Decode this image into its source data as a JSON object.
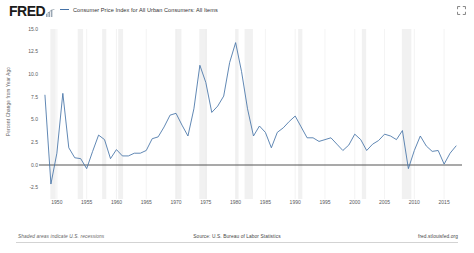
{
  "header": {
    "logo": "FRED",
    "logo_mark": "fred-bar-mark",
    "legend_label": "Consumer Price Index for All Urban Consumers: All Items",
    "legend_color": "#4572a7",
    "expand_label": "expand-icon"
  },
  "footer": {
    "left": "Shaded areas indicate U.S. recessions",
    "center": "Source: U.S. Bureau of Labor Statistics",
    "right": "fred.stlouisfed.org"
  },
  "chart_data": {
    "type": "line",
    "title": "Consumer Price Index for All Urban Consumers: All Items",
    "xlabel": "",
    "ylabel": "Percent Change from Year Ago",
    "grid": true,
    "legend_position": "top",
    "line_color": "#4572a7",
    "zero_line_color": "#555555",
    "recession_band_color": "#e6e6e6",
    "xlim": [
      1947,
      2018
    ],
    "ylim": [
      -3.75,
      15.0
    ],
    "ytick_labels": [
      "15.0",
      "12.5",
      "10.0",
      "7.5",
      "5.0",
      "2.5",
      "0.0",
      "-2.5"
    ],
    "ytick_values": [
      15.0,
      12.5,
      10.0,
      7.5,
      5.0,
      2.5,
      0.0,
      -2.5
    ],
    "xtick_labels": [
      "1950",
      "1955",
      "1960",
      "1965",
      "1970",
      "1975",
      "1980",
      "1985",
      "1990",
      "1995",
      "2000",
      "2005",
      "2010",
      "2015"
    ],
    "xtick_values": [
      1950,
      1955,
      1960,
      1965,
      1970,
      1975,
      1980,
      1985,
      1990,
      1995,
      2000,
      2005,
      2010,
      2015
    ],
    "x": [
      1948,
      1949,
      1950,
      1951,
      1952,
      1953,
      1954,
      1955,
      1956,
      1957,
      1958,
      1959,
      1960,
      1961,
      1962,
      1963,
      1964,
      1965,
      1966,
      1967,
      1968,
      1969,
      1970,
      1971,
      1972,
      1973,
      1974,
      1975,
      1976,
      1977,
      1978,
      1979,
      1980,
      1981,
      1982,
      1983,
      1984,
      1985,
      1986,
      1987,
      1988,
      1989,
      1990,
      1991,
      1992,
      1993,
      1994,
      1995,
      1996,
      1997,
      1998,
      1999,
      2000,
      2001,
      2002,
      2003,
      2004,
      2005,
      2006,
      2007,
      2008,
      2009,
      2010,
      2011,
      2012,
      2013,
      2014,
      2015,
      2016,
      2017
    ],
    "values": [
      7.7,
      -2.1,
      1.3,
      7.9,
      1.9,
      0.8,
      0.7,
      -0.4,
      1.5,
      3.3,
      2.8,
      0.7,
      1.7,
      1.0,
      1.0,
      1.3,
      1.3,
      1.6,
      2.9,
      3.1,
      4.2,
      5.5,
      5.7,
      4.4,
      3.2,
      6.2,
      11.0,
      9.1,
      5.8,
      6.5,
      7.6,
      11.3,
      13.5,
      10.3,
      6.2,
      3.2,
      4.3,
      3.6,
      1.9,
      3.6,
      4.1,
      4.8,
      5.4,
      4.2,
      3.0,
      3.0,
      2.6,
      2.8,
      3.0,
      2.3,
      1.6,
      2.2,
      3.4,
      2.8,
      1.6,
      2.3,
      2.7,
      3.4,
      3.2,
      2.8,
      3.8,
      -0.4,
      1.6,
      3.2,
      2.1,
      1.5,
      1.6,
      0.1,
      1.3,
      2.1
    ],
    "series_name": "Consumer Price Index for All Urban Consumers: All Items",
    "recessions": [
      [
        1948.9,
        1949.8
      ],
      [
        1953.5,
        1954.4
      ],
      [
        1957.6,
        1958.3
      ],
      [
        1960.3,
        1961.1
      ],
      [
        1969.9,
        1970.9
      ],
      [
        1973.9,
        1975.2
      ],
      [
        1980.0,
        1980.5
      ],
      [
        1981.5,
        1982.9
      ],
      [
        1990.5,
        1991.2
      ],
      [
        2001.2,
        2001.9
      ],
      [
        2007.9,
        2009.5
      ]
    ]
  }
}
